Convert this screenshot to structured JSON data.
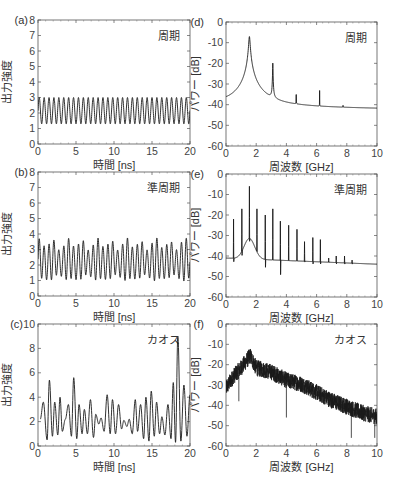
{
  "chart_data": [
    {
      "id": "a",
      "panel_label": "(a)",
      "type": "line",
      "annotation": "周期",
      "xlabel": "時間 [ns]",
      "ylabel": "出力強度",
      "xlim": [
        0,
        20
      ],
      "ylim": [
        0,
        8
      ],
      "xticks": [
        0,
        5,
        10,
        15,
        20
      ],
      "yticks": [
        0,
        1,
        2,
        3,
        4,
        5,
        6,
        7,
        8
      ],
      "signal": {
        "kind": "periodic",
        "freq_ghz": 1.55,
        "min": 1.3,
        "max": 3.0
      },
      "box": {
        "x": 38,
        "y": 20,
        "w": 152,
        "h": 124
      }
    },
    {
      "id": "b",
      "panel_label": "(b)",
      "type": "line",
      "annotation": "準周期",
      "xlabel": "時間 [ns]",
      "ylabel": "出力強度",
      "xlim": [
        0,
        20
      ],
      "ylim": [
        0,
        8
      ],
      "xticks": [
        0,
        5,
        10,
        15,
        20
      ],
      "yticks": [
        0,
        1,
        2,
        3,
        4,
        5,
        6,
        7,
        8
      ],
      "signal": {
        "kind": "quasiperiodic",
        "freq_ghz": 1.55,
        "min": 1.0,
        "max": 3.5
      },
      "box": {
        "x": 38,
        "y": 172,
        "w": 152,
        "h": 124
      }
    },
    {
      "id": "c",
      "panel_label": "(c)",
      "type": "line",
      "annotation": "カオス",
      "xlabel": "時間 [ns]",
      "ylabel": "出力強度",
      "xlim": [
        0,
        20
      ],
      "ylim": [
        0,
        10
      ],
      "xticks": [
        0,
        5,
        10,
        15,
        20
      ],
      "yticks": [
        0,
        2,
        4,
        6,
        8,
        10
      ],
      "signal": {
        "kind": "chaos",
        "min": 0.3,
        "max": 9.0,
        "peaks": [
          [
            0.3,
            2.2
          ],
          [
            0.7,
            3.6
          ],
          [
            1.2,
            0.5
          ],
          [
            1.5,
            5.4
          ],
          [
            1.9,
            0.8
          ],
          [
            2.2,
            3.6
          ],
          [
            2.6,
            0.9
          ],
          [
            2.9,
            4.0
          ],
          [
            3.2,
            1.2
          ],
          [
            3.6,
            2.2
          ],
          [
            4.0,
            3.4
          ],
          [
            4.4,
            0.8
          ],
          [
            4.7,
            5.6
          ],
          [
            5.1,
            0.6
          ],
          [
            5.4,
            3.4
          ],
          [
            5.8,
            1.0
          ],
          [
            6.1,
            3.0
          ],
          [
            6.5,
            1.0
          ],
          [
            6.9,
            3.8
          ],
          [
            7.3,
            0.7
          ],
          [
            7.6,
            2.6
          ],
          [
            8.0,
            1.8
          ],
          [
            8.3,
            2.3
          ],
          [
            8.7,
            1.2
          ],
          [
            9.1,
            4.2
          ],
          [
            9.5,
            1.0
          ],
          [
            9.8,
            3.8
          ],
          [
            10.2,
            1.0
          ],
          [
            10.6,
            3.4
          ],
          [
            11.0,
            1.4
          ],
          [
            11.3,
            2.1
          ],
          [
            11.7,
            1.6
          ],
          [
            12.0,
            2.2
          ],
          [
            12.4,
            1.0
          ],
          [
            12.8,
            3.8
          ],
          [
            13.1,
            1.2
          ],
          [
            13.5,
            3.4
          ],
          [
            13.9,
            0.6
          ],
          [
            14.2,
            4.0
          ],
          [
            14.6,
            0.4
          ],
          [
            14.9,
            4.5
          ],
          [
            15.3,
            0.8
          ],
          [
            15.6,
            3.6
          ],
          [
            16.0,
            1.0
          ],
          [
            16.3,
            2.4
          ],
          [
            16.7,
            0.9
          ],
          [
            17.1,
            3.4
          ],
          [
            17.5,
            0.6
          ],
          [
            17.8,
            5.2
          ],
          [
            18.1,
            0.3
          ],
          [
            18.4,
            9.0
          ],
          [
            18.8,
            0.4
          ],
          [
            19.2,
            5.0
          ],
          [
            19.6,
            0.8
          ],
          [
            20.0,
            4.2
          ]
        ]
      },
      "box": {
        "x": 38,
        "y": 324,
        "w": 152,
        "h": 122
      }
    },
    {
      "id": "d",
      "panel_label": "(d)",
      "type": "line",
      "annotation": "周期",
      "xlabel": "周波数 [GHz]",
      "ylabel": "パワー [dB]",
      "xlim": [
        0,
        10
      ],
      "ylim": [
        -60,
        0
      ],
      "xticks": [
        0,
        2,
        4,
        6,
        8,
        10
      ],
      "yticks": [
        0,
        -10,
        -20,
        -30,
        -40,
        -50,
        -60
      ],
      "baseline": {
        "start": -40,
        "end": -42
      },
      "peaks": [
        {
          "f": 1.55,
          "db": -7,
          "width": 0.35
        },
        {
          "f": 3.1,
          "db": -20,
          "width": 0.1
        },
        {
          "f": 4.65,
          "db": -29,
          "width": 0.02
        },
        {
          "f": 6.2,
          "db": -34,
          "width": 0.02
        },
        {
          "f": 7.75,
          "db": -40,
          "width": 0.02
        }
      ],
      "box": {
        "x": 226,
        "y": 22,
        "w": 151,
        "h": 124
      }
    },
    {
      "id": "e",
      "panel_label": "(e)",
      "type": "line",
      "annotation": "準周期",
      "xlabel": "周波数 [GHz]",
      "ylabel": "パワー [dB]",
      "xlim": [
        0,
        10
      ],
      "ylim": [
        -60,
        0
      ],
      "xticks": [
        0,
        2,
        4,
        6,
        8,
        10
      ],
      "yticks": [
        0,
        -10,
        -20,
        -30,
        -40,
        -50,
        -60
      ],
      "baseline": {
        "start": -41,
        "end": -44
      },
      "peaks": [
        {
          "f": 0.5,
          "db": -22,
          "dip": -43
        },
        {
          "f": 1.05,
          "db": -17,
          "dip": -40
        },
        {
          "f": 1.55,
          "db": -6,
          "dip": -33
        },
        {
          "f": 2.05,
          "db": -17,
          "dip": -38
        },
        {
          "f": 2.6,
          "db": -20,
          "dip": -46
        },
        {
          "f": 3.1,
          "db": -17,
          "dip": -36
        },
        {
          "f": 3.6,
          "db": -23,
          "dip": -50
        },
        {
          "f": 4.15,
          "db": -25,
          "dip": -41
        },
        {
          "f": 4.7,
          "db": -27,
          "dip": -42
        },
        {
          "f": 5.2,
          "db": -33,
          "dip": -43
        },
        {
          "f": 5.75,
          "db": -31,
          "dip": -44
        },
        {
          "f": 6.25,
          "db": -32,
          "dip": -44
        },
        {
          "f": 6.8,
          "db": -41,
          "dip": -43
        },
        {
          "f": 7.3,
          "db": -40,
          "dip": -44
        },
        {
          "f": 7.85,
          "db": -40,
          "dip": -44
        },
        {
          "f": 8.35,
          "db": -42,
          "dip": -44
        }
      ],
      "box": {
        "x": 226,
        "y": 174,
        "w": 151,
        "h": 123
      }
    },
    {
      "id": "f",
      "panel_label": "(f)",
      "type": "line",
      "annotation": "カオス",
      "xlabel": "周波数 [GHz]",
      "ylabel": "パワー [dB]",
      "xlim": [
        0,
        10
      ],
      "ylim": [
        -60,
        0
      ],
      "xticks": [
        0,
        2,
        4,
        6,
        8,
        10
      ],
      "yticks": [
        0,
        -10,
        -20,
        -30,
        -40,
        -50,
        -60
      ],
      "envelope": [
        [
          0,
          -30
        ],
        [
          0.5,
          -24
        ],
        [
          1.0,
          -20
        ],
        [
          1.6,
          -14
        ],
        [
          2.0,
          -20
        ],
        [
          2.5,
          -21
        ],
        [
          3.0,
          -22
        ],
        [
          3.5,
          -24
        ],
        [
          4.0,
          -26
        ],
        [
          5.0,
          -28
        ],
        [
          6.0,
          -32
        ],
        [
          7.0,
          -36
        ],
        [
          8.0,
          -39
        ],
        [
          9.0,
          -42
        ],
        [
          10.0,
          -44
        ]
      ],
      "deep_dips": [
        [
          0.85,
          -38
        ],
        [
          4.0,
          -46
        ],
        [
          8.3,
          -56
        ],
        [
          9.85,
          -56
        ]
      ],
      "box": {
        "x": 226,
        "y": 324,
        "w": 151,
        "h": 122
      }
    }
  ]
}
